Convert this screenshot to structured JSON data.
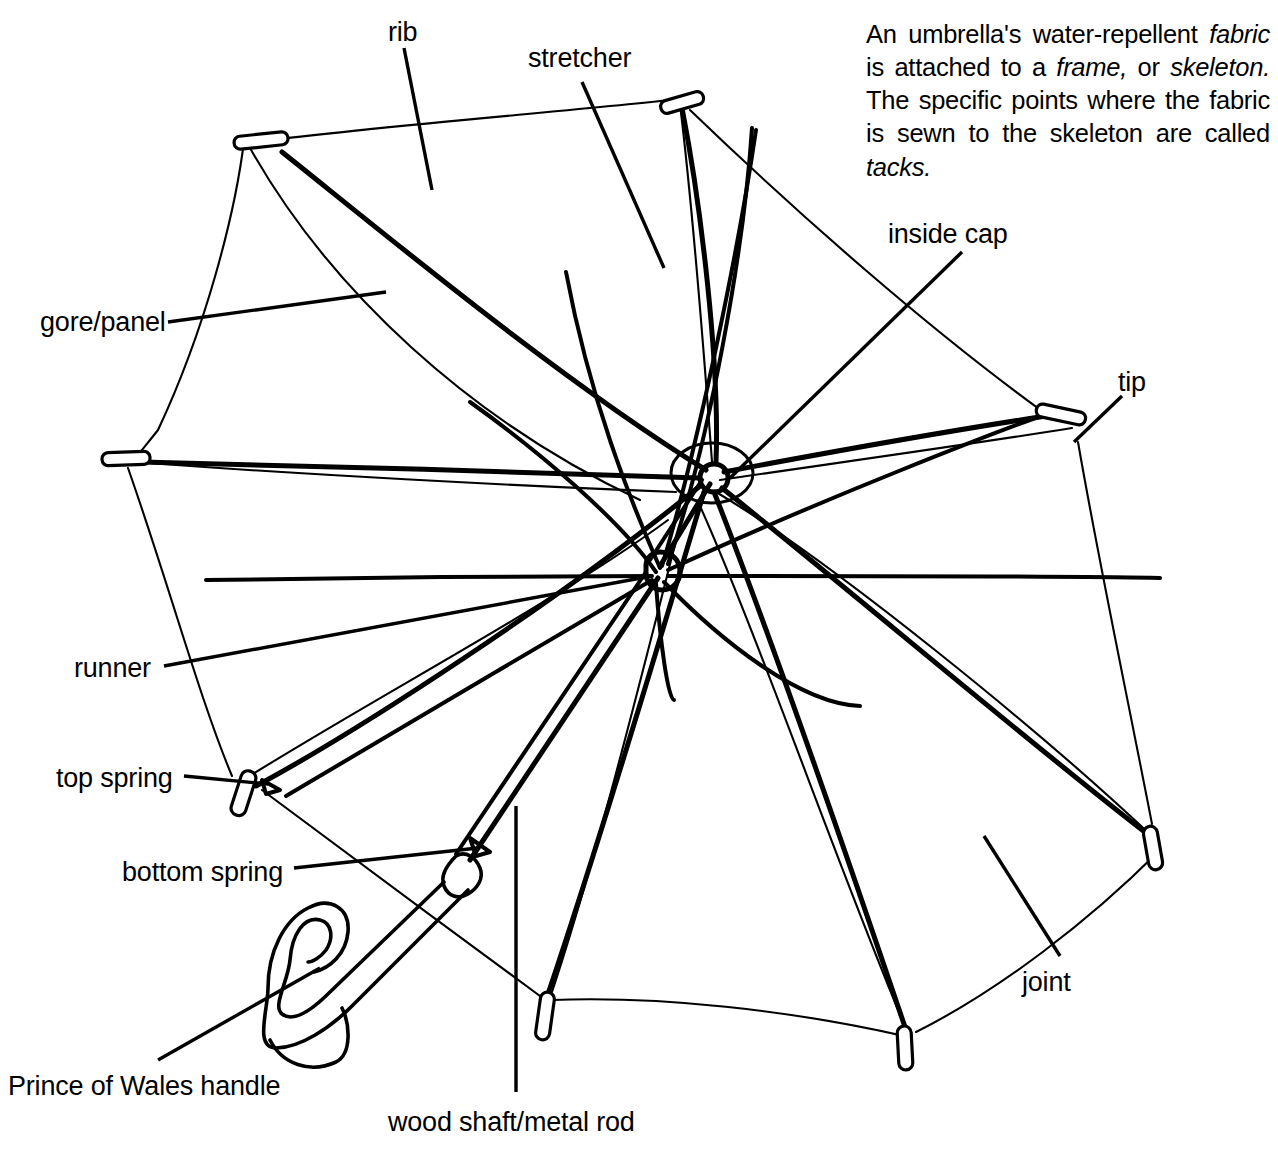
{
  "diagram": {
    "subject": "umbrella",
    "style": "black-and-white line drawing",
    "background_color": "#ffffff",
    "line_color": "#000000"
  },
  "caption": {
    "lines": [
      "An umbrella's water-repellent fabric",
      "is attached to a frame, or skeleton.",
      "The specific points where the fabric",
      "is sewn to the skeleton are called",
      "tacks."
    ],
    "full_text": "An umbrella's water-repellent fabric is attached to a frame, or skeleton. The specific points where the fabric is sewn to the skeleton are called tacks.",
    "italic_terms": [
      "fabric",
      "frame",
      "skeleton",
      "tacks"
    ],
    "segments": [
      {
        "text": "An umbrella's water-repellent ",
        "italic": false
      },
      {
        "text": "fabric",
        "italic": true
      },
      {
        "text": " is attached to a ",
        "italic": false
      },
      {
        "text": "frame,",
        "italic": true
      },
      {
        "text": " or ",
        "italic": false
      },
      {
        "text": "skeleton.",
        "italic": true
      },
      {
        "text": " The specific points where the fabric is sewn to the skeleton are called ",
        "italic": false
      },
      {
        "text": "tacks.",
        "italic": true
      }
    ]
  },
  "labels": [
    {
      "id": "rib",
      "text": "rib",
      "x": 388,
      "y": 18,
      "anchor": "left"
    },
    {
      "id": "stretcher",
      "text": "stretcher",
      "x": 528,
      "y": 44,
      "anchor": "left"
    },
    {
      "id": "inside-cap",
      "text": "inside cap",
      "x": 888,
      "y": 220,
      "anchor": "left"
    },
    {
      "id": "gore-panel",
      "text": "gore/panel",
      "x": 40,
      "y": 308,
      "anchor": "left"
    },
    {
      "id": "tip",
      "text": "tip",
      "x": 1118,
      "y": 368,
      "anchor": "left"
    },
    {
      "id": "runner",
      "text": "runner",
      "x": 74,
      "y": 654,
      "anchor": "left"
    },
    {
      "id": "top-spring",
      "text": "top spring",
      "x": 56,
      "y": 764,
      "anchor": "left"
    },
    {
      "id": "bottom-spring",
      "text": "bottom spring",
      "x": 122,
      "y": 858,
      "anchor": "left"
    },
    {
      "id": "joint",
      "text": "joint",
      "x": 1022,
      "y": 968,
      "anchor": "left"
    },
    {
      "id": "handle",
      "text": "Prince of Wales handle",
      "x": 8,
      "y": 1072,
      "anchor": "left"
    },
    {
      "id": "shaft",
      "text": "wood shaft/metal rod",
      "x": 388,
      "y": 1108,
      "anchor": "left"
    }
  ],
  "parts_list": [
    "rib",
    "stretcher",
    "inside cap",
    "gore/panel",
    "tip",
    "runner",
    "top spring",
    "bottom spring",
    "joint",
    "Prince of Wales handle",
    "wood shaft/metal rod"
  ]
}
